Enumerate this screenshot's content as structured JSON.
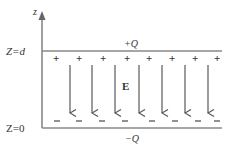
{
  "diagram": {
    "type": "parallel-plate-capacitor",
    "axis": {
      "label": "z"
    },
    "top_plate": {
      "position_label": "Z=d",
      "charge_label": "+Q",
      "charge_sign": "+",
      "sign_count": 8
    },
    "bottom_plate": {
      "position_label": "Z=0",
      "charge_label": "−Q",
      "charge_sign": "–",
      "sign_count": 8
    },
    "field": {
      "label": "E",
      "arrow_count": 7,
      "direction": "down"
    },
    "colors": {
      "line": "#666666",
      "text": "#333333",
      "background": "#ffffff"
    }
  }
}
